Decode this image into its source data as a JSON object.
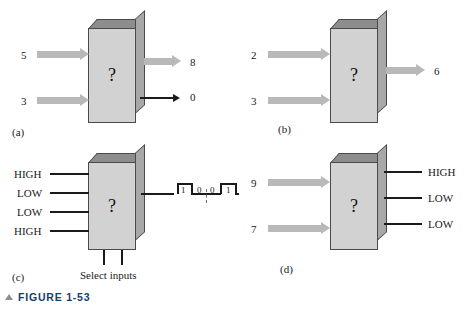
{
  "figure": {
    "caption": "FIGURE 1-53",
    "marker_icon": "triangle-up-icon"
  },
  "panels": [
    {
      "id": "a",
      "letter": "(a)",
      "block_label": "?",
      "inputs": [
        {
          "label": "5",
          "style": "block-arrow"
        },
        {
          "label": "3",
          "style": "block-arrow"
        }
      ],
      "outputs": [
        {
          "label": "8",
          "style": "block-arrow"
        },
        {
          "label": "0",
          "style": "thin-arrow"
        }
      ]
    },
    {
      "id": "b",
      "letter": "(b)",
      "block_label": "?",
      "inputs": [
        {
          "label": "2",
          "style": "block-arrow"
        },
        {
          "label": "3",
          "style": "block-arrow"
        }
      ],
      "outputs": [
        {
          "label": "6",
          "style": "block-arrow"
        }
      ]
    },
    {
      "id": "c",
      "letter": "(c)",
      "block_label": "?",
      "inputs": [
        {
          "label": "HIGH",
          "style": "line"
        },
        {
          "label": "LOW",
          "style": "line"
        },
        {
          "label": "LOW",
          "style": "line"
        },
        {
          "label": "HIGH",
          "style": "line"
        }
      ],
      "select_caption": "Select inputs",
      "select_count": 2,
      "outputs": [
        {
          "label": "",
          "style": "line-to-waveform"
        }
      ],
      "waveform": {
        "levels": [
          "1",
          "0",
          "0",
          "1"
        ],
        "divider_after_index": 1
      }
    },
    {
      "id": "d",
      "letter": "(d)",
      "block_label": "?",
      "inputs": [
        {
          "label": "9",
          "style": "block-arrow"
        },
        {
          "label": "7",
          "style": "block-arrow"
        }
      ],
      "outputs": [
        {
          "label": "HIGH",
          "style": "line"
        },
        {
          "label": "LOW",
          "style": "line"
        },
        {
          "label": "LOW",
          "style": "line"
        }
      ]
    }
  ],
  "colors": {
    "box_front": "#d2d2d2",
    "box_top": "#8d8d8d",
    "box_side": "#a8a8a8",
    "arrow_gray": "#b9b9b9",
    "line_black": "#1a1a1a",
    "caption_blue": "#13406b"
  }
}
